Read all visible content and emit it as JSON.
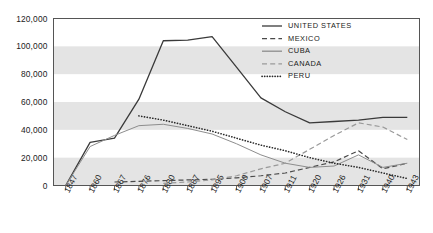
{
  "chart_data": {
    "type": "line",
    "title": "",
    "xlabel": "",
    "ylabel": "",
    "ylim": [
      0,
      120000
    ],
    "ytick_labels": [
      "120,000",
      "100,000",
      "80,000",
      "60,000",
      "40,000",
      "20,000",
      "0"
    ],
    "ytick_values": [
      120000,
      100000,
      80000,
      60000,
      40000,
      20000,
      0
    ],
    "grid": false,
    "band_shading": true,
    "legend_position": "top-right",
    "categories": [
      "1847",
      "1860",
      "1867",
      "1876",
      "1880",
      "1887",
      "1895",
      "1900",
      "1907",
      "1911",
      "1920",
      "1926",
      "1931",
      "1940",
      "1943"
    ],
    "series": [
      {
        "name": "UNITED STATES",
        "style": "solid",
        "color": "#3a3a3a",
        "width": 1.3,
        "values": [
          0,
          31000,
          34000,
          62000,
          104000,
          104500,
          107000,
          85000,
          63000,
          53000,
          45000,
          46000,
          47000,
          49000,
          49000
        ]
      },
      {
        "name": "MEXICO",
        "style": "dashed",
        "color": "#4a4a4a",
        "width": 1.2,
        "values": [
          null,
          null,
          2500,
          3000,
          3500,
          4000,
          4500,
          5500,
          7000,
          9000,
          13000,
          17000,
          25000,
          12000,
          16000
        ]
      },
      {
        "name": "CUBA",
        "style": "solid",
        "color": "#8d8d8d",
        "width": 1.0,
        "values": [
          0,
          28000,
          36000,
          43000,
          44000,
          41000,
          37000,
          30000,
          22000,
          16000,
          13000,
          14000,
          22000,
          13000,
          16000
        ]
      },
      {
        "name": "CANADA",
        "style": "dashed",
        "color": "#9a9a9a",
        "width": 1.2,
        "values": [
          null,
          null,
          null,
          null,
          1500,
          2500,
          4000,
          7000,
          12000,
          16000,
          26000,
          36000,
          45000,
          42000,
          33000
        ]
      },
      {
        "name": "PERU",
        "style": "dotted",
        "color": "#2b2b2b",
        "width": 1.6,
        "values": [
          null,
          null,
          null,
          50000,
          47000,
          43000,
          39000,
          34000,
          29000,
          25000,
          20000,
          16000,
          13000,
          9000,
          5000
        ]
      }
    ],
    "legend": [
      {
        "label": "UNITED STATES",
        "style": "solid",
        "color": "#3a3a3a"
      },
      {
        "label": "MEXICO",
        "style": "dashed",
        "color": "#4a4a4a"
      },
      {
        "label": "CUBA",
        "style": "solid",
        "color": "#8d8d8d"
      },
      {
        "label": "CANADA",
        "style": "dashed",
        "color": "#9a9a9a"
      },
      {
        "label": "PERU",
        "style": "dotted",
        "color": "#2b2b2b"
      }
    ]
  }
}
